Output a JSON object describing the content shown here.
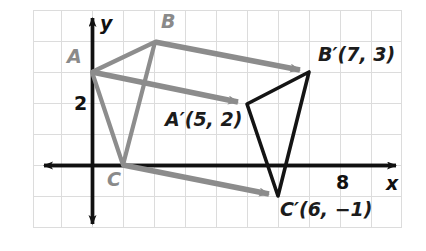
{
  "figure": {
    "background_color": "#ffffff",
    "grid": {
      "line_color": "#d9d9d9",
      "spacing_px": 31,
      "origin_px": {
        "x": 92,
        "y": 165
      },
      "bounds_px": {
        "left": 33,
        "top": 10,
        "right": 402,
        "bottom": 228
      },
      "x_range": [
        -2,
        10
      ],
      "y_range": [
        -2,
        5
      ],
      "visible": true
    },
    "axes": {
      "color": "#111111",
      "x_axis_label": "x",
      "y_axis_label": "y",
      "x_tick_label": "8",
      "y_tick_label": "2",
      "x_tick_value": 8,
      "y_tick_value": 2,
      "arrowheads": [
        "left",
        "right",
        "up",
        "down"
      ]
    },
    "preimage": {
      "name": "Triangle ABC",
      "stroke_color": "#8a8a8a",
      "vertices": [
        {
          "id": "A",
          "label": "A",
          "x": 0,
          "y": 3,
          "px": 92,
          "py": 72
        },
        {
          "id": "B",
          "label": "B",
          "x": 2,
          "y": 4,
          "px": 155,
          "py": 42
        },
        {
          "id": "C",
          "label": "C",
          "x": 1,
          "y": 0,
          "px": 123,
          "py": 165
        }
      ]
    },
    "image": {
      "name": "Triangle A'B'C'",
      "stroke_color": "#141414",
      "vertices": [
        {
          "id": "Aprime",
          "label": "A′(5, 2)",
          "x": 5,
          "y": 2,
          "px": 247,
          "py": 104
        },
        {
          "id": "Bprime",
          "label": "B′(7, 3)",
          "x": 7,
          "y": 3,
          "px": 309,
          "py": 72
        },
        {
          "id": "Cprime",
          "label": "C′(6, −1)",
          "x": 6,
          "y": -1,
          "px": 278,
          "py": 196
        }
      ]
    },
    "translation_arrows": {
      "color": "#8c8c8c",
      "vector": {
        "dx": 5,
        "dy": -1
      },
      "items": [
        {
          "from": "A",
          "to": "Aprime",
          "x1": 92,
          "y1": 72,
          "x2": 247,
          "y2": 104
        },
        {
          "from": "B",
          "to": "Bprime",
          "x1": 155,
          "y1": 42,
          "x2": 309,
          "y2": 72
        },
        {
          "from": "C",
          "to": "Cprime",
          "x1": 123,
          "y1": 165,
          "x2": 278,
          "y2": 196
        }
      ]
    },
    "labels": {
      "A": "A",
      "B": "B",
      "C": "C",
      "A_prime": "A′(5, 2)",
      "B_prime": "B′(7, 3)",
      "C_prime": "C′(6, −1)",
      "x_axis": "x",
      "y_axis": "y",
      "tick_y_2": "2",
      "tick_x_8": "8"
    }
  }
}
